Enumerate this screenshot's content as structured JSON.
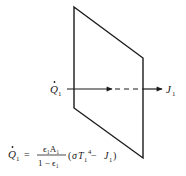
{
  "diagram": {
    "type": "radiation-surface-resistance",
    "colors": {
      "stroke": "#1a1a1a",
      "background": "#ffffff"
    },
    "surface": {
      "shape": "parallelogram",
      "vertices": [
        [
          74,
          7
        ],
        [
          143,
          58
        ],
        [
          143,
          158
        ],
        [
          74,
          108
        ]
      ]
    },
    "arrow": {
      "y": 89,
      "solid_start_x": 67,
      "first_head_x": 112,
      "dash_end_x": 143,
      "end_x": 162
    },
    "labels": {
      "q_left": {
        "symbol": "Q",
        "sub": "1",
        "dot": true
      },
      "j_right": {
        "symbol": "J",
        "sub": "1"
      }
    },
    "equation": {
      "lhs_symbol": "Q",
      "lhs_sub": "1",
      "equals": "=",
      "numerator": "ϵ₁A₁",
      "denominator": "1 − ϵ₁",
      "paren_open": "(",
      "sigma": "σ",
      "T": "T",
      "T_sub": "1",
      "T_exp": "4",
      "minus": " − ",
      "J": "J",
      "J_sub": "1",
      "paren_close": ")"
    }
  }
}
